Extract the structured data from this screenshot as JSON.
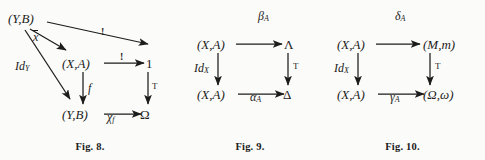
{
  "page": {
    "background": "#fbfbf9",
    "ink": "#1c1c1c",
    "type": "mathematical-commutative-diagrams"
  },
  "figures": [
    {
      "id": "fig8",
      "caption": "Fig. 8.",
      "nodes": {
        "top_left": "(Y,B)",
        "mid_left": "(X,A)",
        "mid_right": "1",
        "bottom_left": "(Y,B)",
        "bottom_right": "Ω"
      },
      "labels": {
        "xbar": "x",
        "id_y": "Id",
        "id_y_sub": "Y",
        "bang_long": "!",
        "bang_mid": "!",
        "f": "f",
        "chi": "χ",
        "chi_sub": "f",
        "truth": "T"
      }
    },
    {
      "id": "fig9",
      "caption": "Fig. 9.",
      "nodes": {
        "top_left": "(X,A)",
        "top_right": "Λ",
        "bottom_left": "(X,A)",
        "bottom_right": "Δ"
      },
      "labels": {
        "top": "β",
        "top_sub": "A",
        "left": "Id",
        "left_sub": "X",
        "bottom": "α",
        "bottom_sub": "A",
        "right": "T"
      }
    },
    {
      "id": "fig10",
      "caption": "Fig. 10.",
      "nodes": {
        "top_left": "(X,A)",
        "top_right": "(M,m)",
        "bottom_left": "(X,A)",
        "bottom_right": "(Ω,ω)"
      },
      "labels": {
        "top": "δ",
        "top_sub": "A",
        "left": "Id",
        "left_sub": "X",
        "bottom": "γ",
        "bottom_sub": "A",
        "right": "T"
      }
    }
  ]
}
